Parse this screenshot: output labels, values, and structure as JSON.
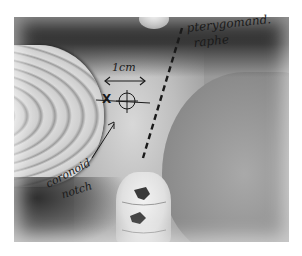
{
  "figure": {
    "type": "grayscale clinical intraoral photograph",
    "annotations": {
      "raphe_label_line1": "pterygomand.",
      "raphe_label_line2": "raphe",
      "scale_label": "1cm",
      "coronoid_label_line1": "coronoid",
      "coronoid_label_line2": "notch",
      "reference_mark": "X"
    },
    "marks": {
      "scale_arrow": "double-headed horizontal arrow, 1 cm",
      "injection_target": "crosshair circle",
      "raphe_line": "dashed line along pterygomandibular raphe",
      "coronoid_arrow": "arrow pointing to coronoid notch"
    },
    "colors": {
      "background": "#ffffff",
      "ink": "#1a1a1a"
    }
  }
}
